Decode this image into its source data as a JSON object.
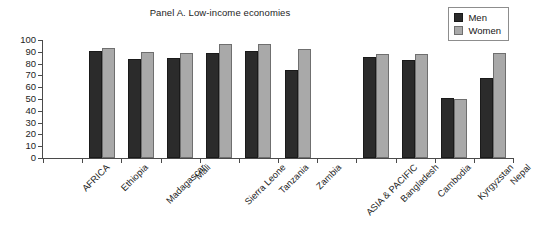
{
  "chart_data": {
    "type": "bar",
    "title": "Panel A. Low-income economies",
    "xlabel": "",
    "ylabel": "",
    "ylim": [
      0,
      100
    ],
    "y_ticks": [
      0,
      10,
      20,
      30,
      40,
      50,
      60,
      70,
      80,
      90,
      100
    ],
    "grid": false,
    "legend_position": "top-right",
    "categories": [
      "AFRICA",
      "Ethiopia",
      "Madagascar",
      "Mali",
      "Sierra Leone",
      "Tanzania",
      "Zambia",
      "ASIA & PACIFIC",
      "Bangladesh",
      "Cambodia",
      "Kyrgyzstan",
      "Nepal"
    ],
    "series": [
      {
        "name": "Men",
        "color": "#2b2b2b",
        "values": [
          null,
          91,
          84,
          85,
          89,
          91,
          75,
          null,
          86,
          83,
          51,
          68
        ]
      },
      {
        "name": "Women",
        "color": "#a9a9a9",
        "values": [
          null,
          93,
          90,
          89,
          97,
          97,
          92,
          null,
          88,
          88,
          50,
          89
        ]
      }
    ]
  },
  "legend": {
    "entries": [
      {
        "label": "Men",
        "swatch": "#2b2b2b",
        "icon": "legend-square-icon"
      },
      {
        "label": "Women",
        "swatch": "#a9a9a9",
        "icon": "legend-square-icon"
      }
    ]
  },
  "colors": {
    "men": "#2b2b2b",
    "women": "#a9a9a9",
    "axis": "#4a4a4a",
    "text": "#1d1d1d",
    "background": "#ffffff"
  }
}
